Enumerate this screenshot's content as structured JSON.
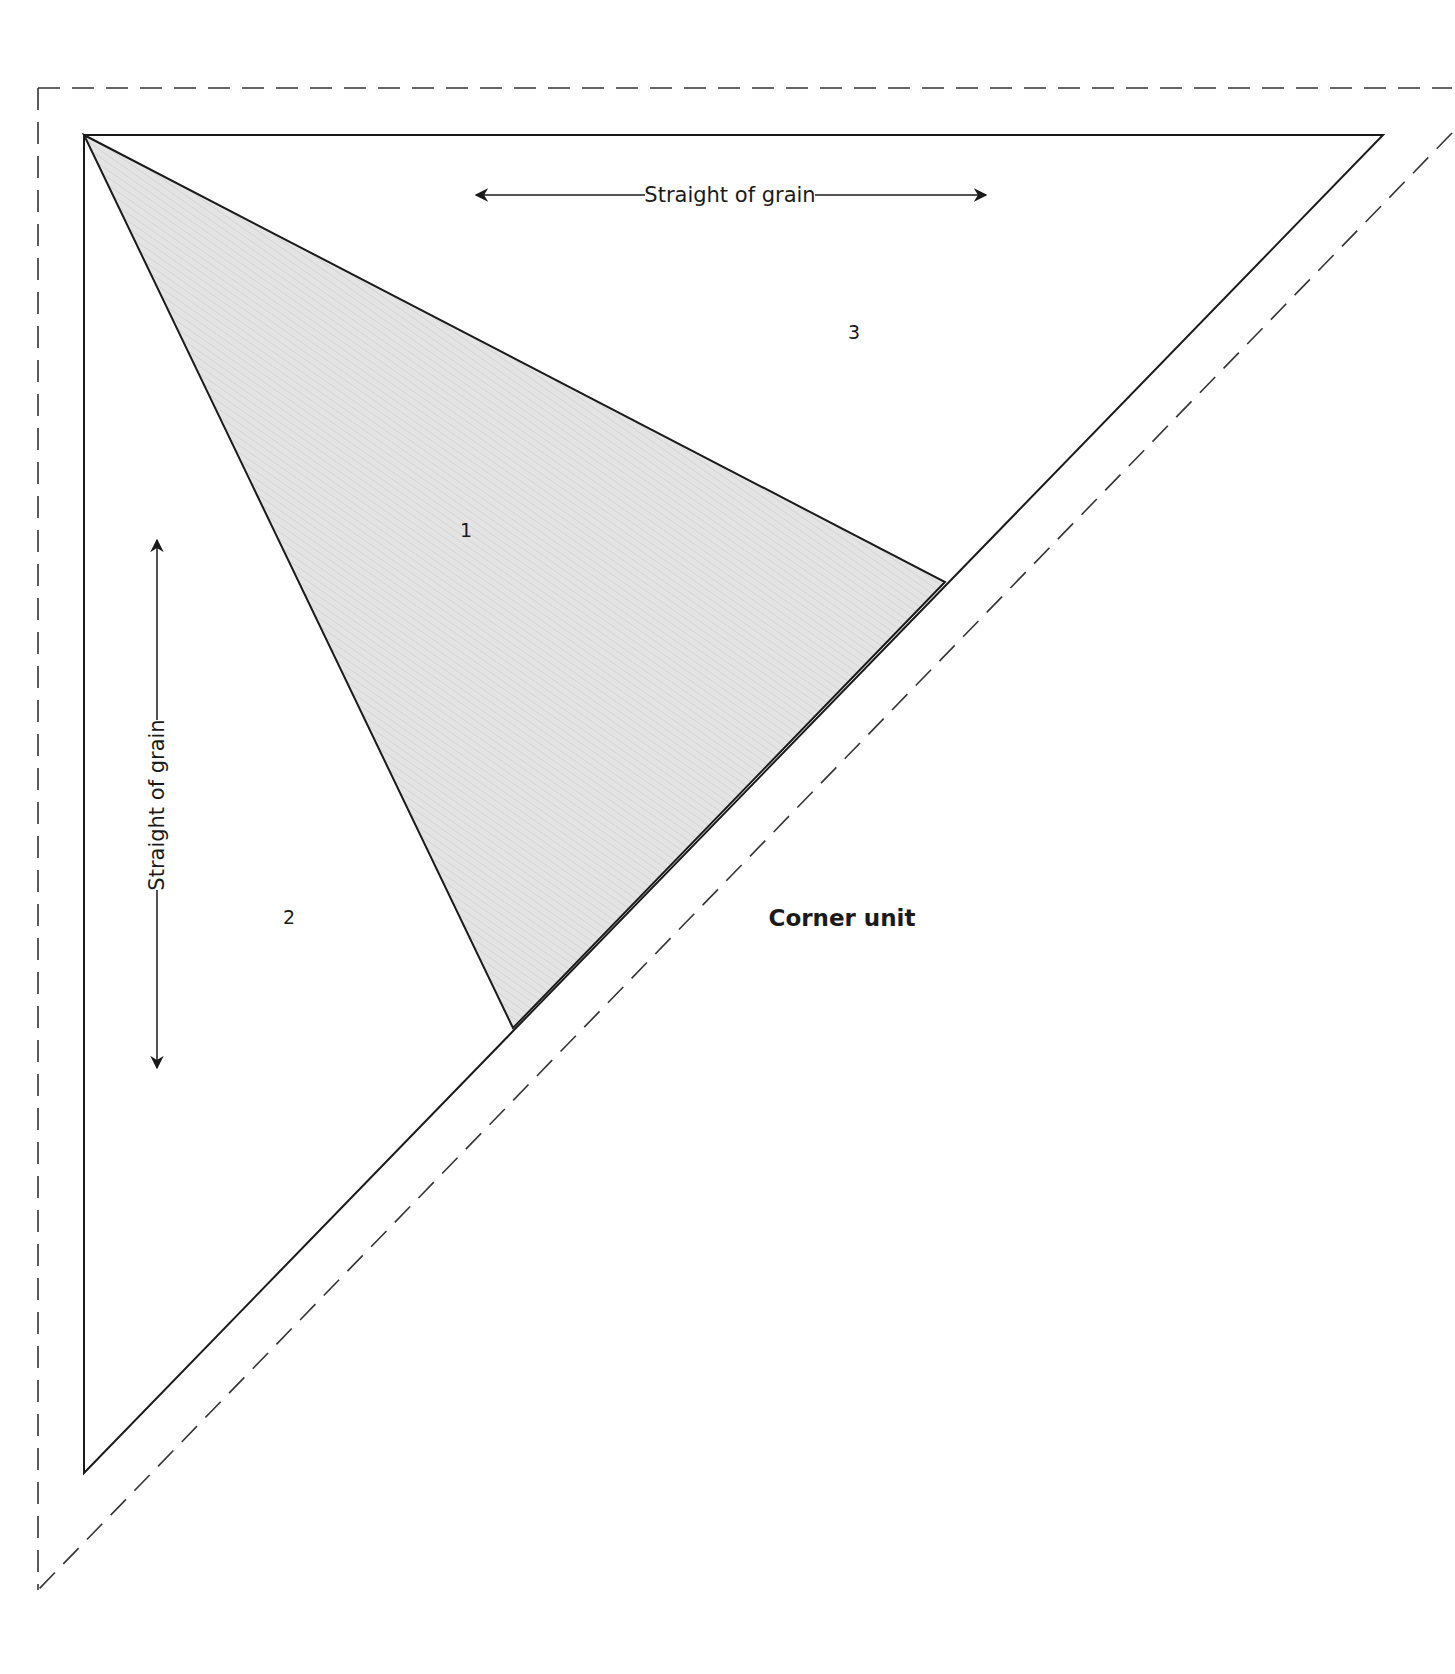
{
  "diagram": {
    "title": "Corner unit",
    "pieces": [
      {
        "id": "1",
        "label": "1",
        "shaded": true
      },
      {
        "id": "2",
        "label": "2",
        "shaded": false
      },
      {
        "id": "3",
        "label": "3",
        "shaded": false
      }
    ],
    "grain_horizontal": "Straight of grain",
    "grain_vertical": "Straight of grain",
    "colors": {
      "line": "#1a1a1a",
      "dashed": "#333333",
      "shade": "#e6e6e6",
      "background": "#ffffff"
    }
  }
}
